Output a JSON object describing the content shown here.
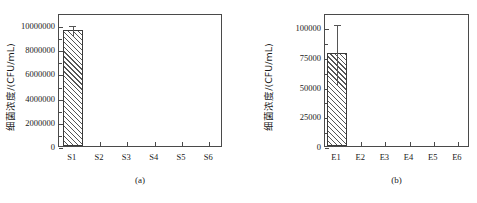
{
  "figure": {
    "background": "#ffffff",
    "axis_color": "#4a4a4a",
    "bar_edge_color": "#3a3a3a",
    "hatch_color": "#555555"
  },
  "chart_data": [
    {
      "type": "bar",
      "panel": "a",
      "caption": "(a)",
      "title": "",
      "xlabel": "",
      "ylabel": "细菌浓度/(CFU/mL)",
      "categories": [
        "S1",
        "S2",
        "S3",
        "S4",
        "S5",
        "S6"
      ],
      "values": [
        9600000,
        0,
        0,
        0,
        0,
        0
      ],
      "error_upper": [
        450000,
        0,
        0,
        0,
        0,
        0
      ],
      "error_lower": [
        450000,
        0,
        0,
        0,
        0,
        0
      ],
      "ylim": [
        0,
        11000000
      ],
      "yticks": [
        0,
        2000000,
        4000000,
        6000000,
        8000000,
        10000000
      ],
      "ytick_labels": [
        "0",
        "2000000",
        "4000000",
        "6000000",
        "8000000",
        "10000000"
      ],
      "minor_ticks": true,
      "grid": false,
      "legend": false,
      "fill": "hatch-diagonal"
    },
    {
      "type": "bar",
      "panel": "b",
      "caption": "(b)",
      "title": "",
      "xlabel": "",
      "ylabel": "细菌浓度/(CFU/mL)",
      "categories": [
        "E1",
        "E2",
        "E3",
        "E4",
        "E5",
        "E6"
      ],
      "values": [
        78500,
        0,
        0,
        0,
        0,
        0
      ],
      "error_upper": [
        25000,
        0,
        0,
        0,
        0,
        0
      ],
      "error_lower": [
        26500,
        0,
        0,
        0,
        0,
        0
      ],
      "ylim": [
        0,
        112000
      ],
      "yticks": [
        0,
        25000,
        50000,
        75000,
        100000
      ],
      "ytick_labels": [
        "0",
        "25000",
        "50000",
        "75000",
        "100000"
      ],
      "minor_ticks": true,
      "grid": false,
      "legend": false,
      "fill": "hatch-diagonal"
    }
  ]
}
